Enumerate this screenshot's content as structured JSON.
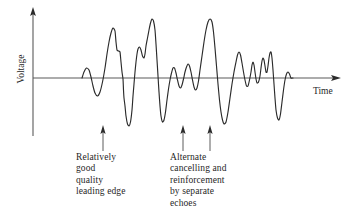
{
  "figure": {
    "background_color": "#ffffff",
    "line_color": "#2b2b2b",
    "axis_color": "#5a5a5a",
    "text_color": "#1f1f1f"
  },
  "axes": {
    "y_label": "Voltage",
    "x_label": "Time",
    "y_axis": {
      "x": 33,
      "top": 8,
      "bottom": 136,
      "arrow": "up-arrow-icon"
    },
    "x_axis": {
      "y": 78,
      "left": 33,
      "right": 340,
      "arrow": "right-arrow-icon"
    }
  },
  "annotations": [
    {
      "id": "leading-edge",
      "arrow_x": 103,
      "arrow_top": 126,
      "arrow_bottom": 151,
      "text_x": 76,
      "text_y": 152,
      "lines": [
        "Relatively",
        "good",
        "quality",
        "leading edge"
      ]
    },
    {
      "id": "echo-cancellation",
      "arrow_x": 183,
      "arrow_top": 126,
      "arrow_bottom": 151,
      "second_arrow_x": 210,
      "text_x": 170,
      "text_y": 152,
      "lines": [
        "Alternate",
        "cancelling and",
        "reinforcement",
        "by separate",
        "echoes"
      ]
    }
  ],
  "captions": {
    "left": "Relatively\ngood\nquality\nleading edge",
    "right": "Alternate\ncancelling and\nreinforcement\nby separate\nechoes"
  },
  "chart_data": {
    "type": "line",
    "title": "",
    "xlabel": "Time",
    "ylabel": "Voltage",
    "grid": false,
    "legend": null,
    "xlim": [
      33,
      340
    ],
    "ylim": [
      136,
      14
    ],
    "baseline_y": 78,
    "series": [
      {
        "name": "received-signal",
        "description": "Radar/sonar echo waveform showing a clean leading edge followed by alternate cancelling and reinforcement from separate echoes.",
        "points": [
          [
            82,
            78
          ],
          [
            84,
            72
          ],
          [
            86.5,
            68
          ],
          [
            89,
            70
          ],
          [
            91,
            77
          ],
          [
            93,
            86
          ],
          [
            95,
            93
          ],
          [
            97.5,
            96
          ],
          [
            100,
            92
          ],
          [
            102.5,
            82
          ],
          [
            105,
            68
          ],
          [
            107,
            54
          ],
          [
            109,
            42
          ],
          [
            111,
            33
          ],
          [
            113,
            28
          ],
          [
            115,
            31
          ],
          [
            116,
            42
          ],
          [
            117,
            50
          ],
          [
            118.5,
            51
          ],
          [
            120,
            52
          ],
          [
            121,
            62
          ],
          [
            122,
            72
          ],
          [
            123,
            79
          ],
          [
            123.5,
            90
          ],
          [
            124,
            98
          ],
          [
            125,
            106
          ],
          [
            126,
            116
          ],
          [
            127.5,
            124
          ],
          [
            129,
            126
          ],
          [
            130.5,
            122
          ],
          [
            132,
            110
          ],
          [
            133,
            96
          ],
          [
            134,
            84
          ],
          [
            135,
            72
          ],
          [
            136,
            62
          ],
          [
            137,
            54
          ],
          [
            138,
            49
          ],
          [
            139.5,
            47
          ],
          [
            141,
            50
          ],
          [
            142.5,
            56
          ],
          [
            144,
            58
          ],
          [
            145,
            54
          ],
          [
            146,
            46
          ],
          [
            147.5,
            38
          ],
          [
            149,
            30
          ],
          [
            150.5,
            23
          ],
          [
            152,
            19
          ],
          [
            153.5,
            21
          ],
          [
            155,
            30
          ],
          [
            156,
            44
          ],
          [
            157,
            60
          ],
          [
            158,
            76
          ],
          [
            159,
            92
          ],
          [
            160,
            106
          ],
          [
            161,
            116
          ],
          [
            162.5,
            122
          ],
          [
            164,
            120
          ],
          [
            165.5,
            112
          ],
          [
            167,
            100
          ],
          [
            168.5,
            89
          ],
          [
            170,
            80
          ],
          [
            171.5,
            73
          ],
          [
            173,
            68
          ],
          [
            174.5,
            68
          ],
          [
            176,
            73
          ],
          [
            177.5,
            80
          ],
          [
            179,
            86
          ],
          [
            180.5,
            88
          ],
          [
            182,
            85
          ],
          [
            183.5,
            79
          ],
          [
            185,
            72
          ],
          [
            186.5,
            67
          ],
          [
            188,
            64
          ],
          [
            189.5,
            66
          ],
          [
            191,
            72
          ],
          [
            192.5,
            80
          ],
          [
            194,
            87
          ],
          [
            195.5,
            90
          ],
          [
            197,
            88
          ],
          [
            198.5,
            81
          ],
          [
            200,
            70
          ],
          [
            202,
            56
          ],
          [
            204,
            42
          ],
          [
            206,
            30
          ],
          [
            208,
            22
          ],
          [
            210,
            19
          ],
          [
            212,
            22
          ],
          [
            213.5,
            32
          ],
          [
            215,
            48
          ],
          [
            216.5,
            66
          ],
          [
            218,
            84
          ],
          [
            219.5,
            100
          ],
          [
            221,
            112
          ],
          [
            222.5,
            120
          ],
          [
            224,
            124
          ],
          [
            226,
            122
          ],
          [
            228,
            112
          ],
          [
            230,
            98
          ],
          [
            232,
            84
          ],
          [
            234,
            72
          ],
          [
            236,
            62
          ],
          [
            237.5,
            55
          ],
          [
            239,
            52
          ],
          [
            240.5,
            55
          ],
          [
            242,
            63
          ],
          [
            243.5,
            72
          ],
          [
            245,
            80
          ],
          [
            246.5,
            86
          ],
          [
            248,
            86
          ],
          [
            249.5,
            80
          ],
          [
            251,
            72
          ],
          [
            252,
            65
          ],
          [
            253,
            62
          ],
          [
            254,
            65
          ],
          [
            255,
            72
          ],
          [
            256,
            79
          ],
          [
            257,
            83
          ],
          [
            258.5,
            82
          ],
          [
            260,
            76
          ],
          [
            261,
            68
          ],
          [
            262,
            61
          ],
          [
            263,
            58
          ],
          [
            264,
            60
          ],
          [
            265,
            66
          ],
          [
            266,
            72
          ],
          [
            267,
            72
          ],
          [
            268,
            66
          ],
          [
            269,
            58
          ],
          [
            270,
            53
          ],
          [
            271,
            52
          ],
          [
            272,
            58
          ],
          [
            273,
            70
          ],
          [
            274,
            84
          ],
          [
            275,
            98
          ],
          [
            276,
            110
          ],
          [
            277.5,
            118
          ],
          [
            279,
            120
          ],
          [
            280.5,
            114
          ],
          [
            282,
            102
          ],
          [
            283.5,
            90
          ],
          [
            285,
            80
          ],
          [
            286.5,
            74
          ],
          [
            288,
            72
          ],
          [
            289.5,
            74
          ],
          [
            291,
            78
          ],
          [
            293,
            78
          ]
        ]
      }
    ]
  }
}
